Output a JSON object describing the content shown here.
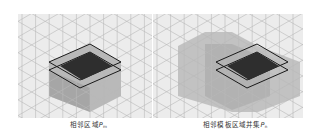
{
  "figure": {
    "background": "#ffffff",
    "grid": {
      "type": "isometric-triangular",
      "line_color": "#b8b8b8",
      "fill_color": "#ececec",
      "node_color": "#8a8a8a"
    },
    "panels": [
      {
        "id": "left",
        "caption": {
          "text": "相邻区域",
          "symbol": "P",
          "subscript": "m"
        },
        "regions": {
          "shaded_prism": "#a8a8a8",
          "top_dark": "#2e2e2e",
          "outline": "#1a1a1a"
        }
      },
      {
        "id": "right",
        "caption": {
          "text": "相邻模板区域并集",
          "symbol": "P",
          "subscript": "n"
        },
        "regions": {
          "union_shade": "#bdbdbd",
          "shaded_prism": "#a8a8a8",
          "top_dark": "#2e2e2e",
          "outline": "#1a1a1a"
        }
      }
    ]
  }
}
